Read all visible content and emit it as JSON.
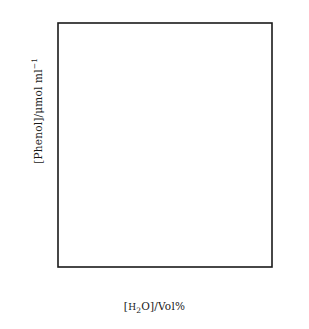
{
  "chart_data": {
    "type": "line",
    "title": "",
    "xlabel": "[H2O]/Vol%",
    "ylabel": "[Phenol]/μmol ml-1",
    "xlim": [
      -0.45,
      9.2
    ],
    "ylim": [
      -1.1,
      23.2
    ],
    "grid": false,
    "legend": "none",
    "xticks": [
      0,
      2,
      4,
      6,
      8
    ],
    "xtick_labels": [
      "0",
      "2",
      "4",
      "6",
      "8"
    ],
    "yticks": [
      0,
      5,
      10,
      15,
      20
    ],
    "ytick_labels": [
      "0",
      "5",
      "10",
      "15",
      "20"
    ],
    "series": [
      {
        "name": "open-circles",
        "marker": "open-circle",
        "line": true,
        "x": [
          0.0,
          0.75,
          2.0,
          3.1,
          4.0,
          8.0
        ],
        "y": [
          0.9,
          3.5,
          8.2,
          10.6,
          11.2,
          19.2
        ]
      },
      {
        "name": "filled-circles",
        "marker": "filled-circle",
        "line": false,
        "x": [
          0.75,
          3.1,
          8.0
        ],
        "y": [
          0.0,
          0.0,
          0.0
        ]
      }
    ]
  },
  "axes": {
    "xlabel_parts": {
      "open_bracket": "[",
      "h": "H",
      "two": "2",
      "o": "O",
      "close": "]/Vol%"
    },
    "ylabel_parts": {
      "main": "[Phenol]/μmol ml",
      "exponent": "−1"
    }
  },
  "colors": {
    "axis": "#1a1a1a",
    "marker_stroke": "#1a1a1a",
    "marker_open_fill": "#ffffff",
    "marker_filled_fill": "#111111",
    "line": "#1a1a1a",
    "background": "#ffffff",
    "tick_text": "#333333"
  }
}
